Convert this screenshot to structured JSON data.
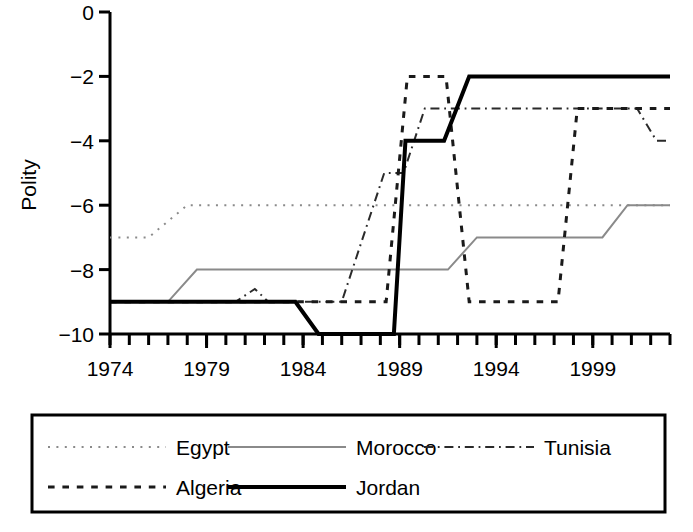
{
  "chart_data": {
    "type": "line",
    "title": "",
    "xlabel": "",
    "ylabel": "Polity",
    "xlim": [
      1974,
      2003
    ],
    "ylim": [
      -10,
      0
    ],
    "yticks": [
      0,
      -2,
      -4,
      -6,
      -8,
      -10
    ],
    "ytick_labels": [
      "0",
      "−2",
      "−4",
      "−6",
      "−8",
      "−10"
    ],
    "xticks": [
      1974,
      1979,
      1984,
      1989,
      1994,
      1999
    ],
    "xtick_labels": [
      "1974",
      "1979",
      "1984",
      "1989",
      "1994",
      "1999"
    ],
    "x_minor_tick_step": 1,
    "grid": false,
    "legend_position": "below-outside",
    "series": [
      {
        "name": "Egypt",
        "style": "dotted",
        "color": "#8a8a8a",
        "width": 2,
        "points": [
          [
            1974,
            -7
          ],
          [
            1976,
            -7
          ],
          [
            1978,
            -6
          ],
          [
            2003,
            -6
          ]
        ]
      },
      {
        "name": "Morocco",
        "style": "solid",
        "color": "#8a8a8a",
        "width": 2,
        "points": [
          [
            1974,
            -9
          ],
          [
            1977,
            -9
          ],
          [
            1978.5,
            -8
          ],
          [
            1991.5,
            -8
          ],
          [
            1993,
            -7
          ],
          [
            1999.5,
            -7
          ],
          [
            2000.8,
            -6
          ],
          [
            2003,
            -6
          ]
        ]
      },
      {
        "name": "Tunisia",
        "style": "dashdot",
        "color": "#2a2a2a",
        "width": 2,
        "points": [
          [
            1974,
            -9
          ],
          [
            1980.5,
            -9
          ],
          [
            1981.5,
            -8.6
          ],
          [
            1982.2,
            -9
          ],
          [
            1986,
            -9
          ],
          [
            1988.2,
            -5
          ],
          [
            1989.2,
            -5
          ],
          [
            1990.3,
            -3
          ],
          [
            2001.3,
            -3
          ],
          [
            2002.3,
            -4
          ],
          [
            2003,
            -4
          ]
        ]
      },
      {
        "name": "Algeria",
        "style": "dashed",
        "color": "#1a1a1a",
        "width": 3,
        "points": [
          [
            1974,
            -9
          ],
          [
            1988.3,
            -9
          ],
          [
            1989.4,
            -2
          ],
          [
            1991.4,
            -2
          ],
          [
            1992.6,
            -9
          ],
          [
            1997.2,
            -9
          ],
          [
            1998.2,
            -3
          ],
          [
            2003,
            -3
          ]
        ]
      },
      {
        "name": "Jordan",
        "style": "solid",
        "color": "#000000",
        "width": 4,
        "points": [
          [
            1974,
            -9
          ],
          [
            1983.6,
            -9
          ],
          [
            1984.8,
            -10
          ],
          [
            1988.7,
            -10
          ],
          [
            1989.3,
            -4
          ],
          [
            1991.3,
            -4
          ],
          [
            1992.6,
            -2
          ],
          [
            2003,
            -2
          ]
        ]
      }
    ]
  },
  "legend": {
    "items": [
      {
        "label": "Egypt",
        "style": "dotted",
        "color": "#8a8a8a"
      },
      {
        "label": "Morocco",
        "style": "solid",
        "color": "#8a8a8a"
      },
      {
        "label": "Tunisia",
        "style": "dashdot",
        "color": "#2a2a2a"
      },
      {
        "label": "Algeria",
        "style": "dashed",
        "color": "#1a1a1a"
      },
      {
        "label": "Jordan",
        "style": "solid",
        "color": "#000000"
      }
    ]
  }
}
